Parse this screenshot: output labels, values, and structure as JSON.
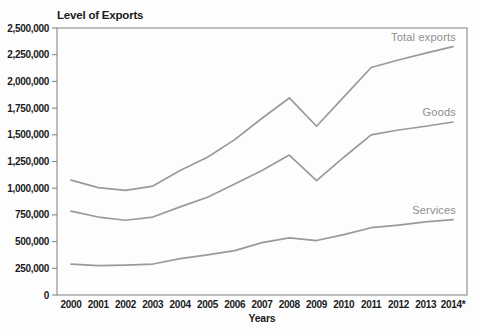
{
  "chart_data": {
    "type": "line",
    "title": "Level of Exports",
    "xlabel": "Years",
    "ylabel": "",
    "categories": [
      "2000",
      "2001",
      "2002",
      "2003",
      "2004",
      "2005",
      "2006",
      "2007",
      "2008",
      "2009",
      "2010",
      "2011",
      "2012",
      "2013",
      "2014*"
    ],
    "series": [
      {
        "name": "Total exports",
        "values": [
          1075000,
          1005000,
          980000,
          1020000,
          1165000,
          1290000,
          1455000,
          1655000,
          1845000,
          1580000,
          1855000,
          2130000,
          2200000,
          2265000,
          2325000
        ]
      },
      {
        "name": "Goods",
        "values": [
          785000,
          730000,
          700000,
          730000,
          825000,
          915000,
          1040000,
          1165000,
          1310000,
          1070000,
          1290000,
          1500000,
          1545000,
          1580000,
          1620000
        ]
      },
      {
        "name": "Services",
        "values": [
          290000,
          275000,
          280000,
          290000,
          340000,
          375000,
          415000,
          490000,
          535000,
          510000,
          565000,
          630000,
          655000,
          685000,
          705000
        ]
      }
    ],
    "ylim": [
      0,
      2500000
    ],
    "yticks": [
      {
        "value": 0,
        "label": "0"
      },
      {
        "value": 250000,
        "label": "250,000"
      },
      {
        "value": 500000,
        "label": "500,000"
      },
      {
        "value": 750000,
        "label": "750,000"
      },
      {
        "value": 1000000,
        "label": "1,000,000"
      },
      {
        "value": 1250000,
        "label": "1,250,000"
      },
      {
        "value": 1500000,
        "label": "1,500,000"
      },
      {
        "value": 1750000,
        "label": "1,750,000"
      },
      {
        "value": 2000000,
        "label": "2,000,000"
      },
      {
        "value": 2250000,
        "label": "2,250,000"
      },
      {
        "value": 2500000,
        "label": "2,500,000"
      }
    ],
    "grid": false,
    "plot_border": true,
    "legend_position": "inline-labels-right",
    "colors": {
      "line": "#9a9a9a",
      "series_label": "#8d8d8d",
      "axis": "#7e7e7e",
      "text": "#1b1b1b",
      "background": "#fdfdfd"
    }
  }
}
